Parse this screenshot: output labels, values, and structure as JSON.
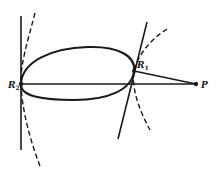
{
  "diagram": {
    "type": "geometric-figure",
    "colors": {
      "ink": "#1a1a1a",
      "background": "#ffffff"
    },
    "labels": {
      "r2": {
        "main": "R",
        "sub": "2"
      },
      "r1": {
        "main": "R",
        "sub": "1"
      },
      "p": {
        "main": "P"
      }
    },
    "points": {
      "R2": [
        21,
        84
      ],
      "R1": [
        134,
        71
      ],
      "P": [
        196,
        84
      ]
    }
  }
}
